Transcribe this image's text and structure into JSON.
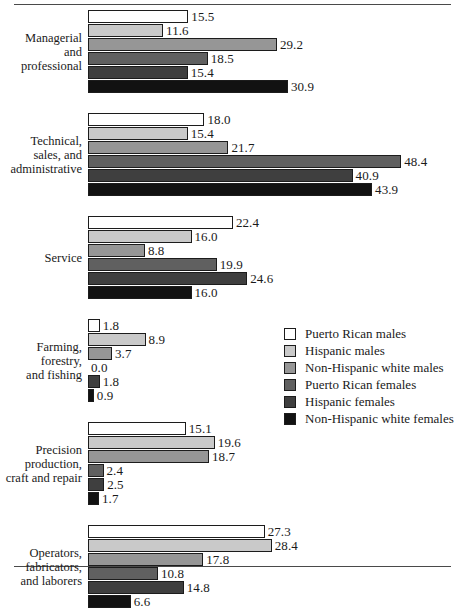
{
  "chart_data": {
    "type": "bar",
    "title": "",
    "subtitle": "",
    "xlabel": "",
    "ylabel": "",
    "orientation": "horizontal",
    "grid": false,
    "legend_position": "middle-right",
    "xlim": [
      0,
      50
    ],
    "categories": [
      "Managerial and professional",
      "Technical, sales, and administrative",
      "Service",
      "Farming, forestry, and fishing",
      "Precision production, craft and repair",
      "Operators, fabricators, and laborers"
    ],
    "series": [
      {
        "name": "Puerto Rican males",
        "color": "#ffffff",
        "values": [
          15.5,
          18.0,
          22.4,
          1.8,
          15.1,
          27.3
        ]
      },
      {
        "name": "Hispanic males",
        "color": "#c9c9c9",
        "values": [
          11.6,
          15.4,
          16.0,
          8.9,
          19.6,
          28.4
        ]
      },
      {
        "name": "Non-Hispanic white males",
        "color": "#969696",
        "values": [
          29.2,
          21.7,
          8.8,
          3.7,
          18.7,
          17.8
        ]
      },
      {
        "name": "Puerto Rican females",
        "color": "#606060",
        "values": [
          18.5,
          48.4,
          19.9,
          0.0,
          2.4,
          10.8
        ]
      },
      {
        "name": "Hispanic females",
        "color": "#3f3f3f",
        "values": [
          15.4,
          40.9,
          24.6,
          1.8,
          2.5,
          14.8
        ]
      },
      {
        "name": "Non-Hispanic white females",
        "color": "#121212",
        "values": [
          30.9,
          43.9,
          16.0,
          0.9,
          1.7,
          6.6
        ]
      }
    ]
  },
  "groups": [
    {
      "label_lines": [
        "Managerial",
        "and",
        "professional"
      ],
      "bars": [
        {
          "value": 15.5,
          "label": "15.5",
          "series": 0
        },
        {
          "value": 11.6,
          "label": "11.6",
          "series": 1
        },
        {
          "value": 29.2,
          "label": "29.2",
          "series": 2
        },
        {
          "value": 18.5,
          "label": "18.5",
          "series": 3
        },
        {
          "value": 15.4,
          "label": "15.4",
          "series": 4
        },
        {
          "value": 30.9,
          "label": "30.9",
          "series": 5
        }
      ]
    },
    {
      "label_lines": [
        "Technical,",
        "sales, and",
        "administrative"
      ],
      "bars": [
        {
          "value": 18.0,
          "label": "18.0",
          "series": 0
        },
        {
          "value": 15.4,
          "label": "15.4",
          "series": 1
        },
        {
          "value": 21.7,
          "label": "21.7",
          "series": 2
        },
        {
          "value": 48.4,
          "label": "48.4",
          "series": 3
        },
        {
          "value": 40.9,
          "label": "40.9",
          "series": 4
        },
        {
          "value": 43.9,
          "label": "43.9",
          "series": 5
        }
      ]
    },
    {
      "label_lines": [
        "Service"
      ],
      "bars": [
        {
          "value": 22.4,
          "label": "22.4",
          "series": 0
        },
        {
          "value": 16.0,
          "label": "16.0",
          "series": 1
        },
        {
          "value": 8.8,
          "label": "8.8",
          "series": 2
        },
        {
          "value": 19.9,
          "label": "19.9",
          "series": 3
        },
        {
          "value": 24.6,
          "label": "24.6",
          "series": 4
        },
        {
          "value": 16.0,
          "label": "16.0",
          "series": 5
        }
      ]
    },
    {
      "label_lines": [
        "Farming,",
        "forestry,",
        "and fishing"
      ],
      "bars": [
        {
          "value": 1.8,
          "label": "1.8",
          "series": 0
        },
        {
          "value": 8.9,
          "label": "8.9",
          "series": 1
        },
        {
          "value": 3.7,
          "label": "3.7",
          "series": 2
        },
        {
          "value": 0.0,
          "label": "0.0",
          "series": 3
        },
        {
          "value": 1.8,
          "label": "1.8",
          "series": 4
        },
        {
          "value": 0.9,
          "label": "0.9",
          "series": 5
        }
      ]
    },
    {
      "label_lines": [
        "Precision",
        "production,",
        "craft and repair"
      ],
      "bars": [
        {
          "value": 15.1,
          "label": "15.1",
          "series": 0
        },
        {
          "value": 19.6,
          "label": "19.6",
          "series": 1
        },
        {
          "value": 18.7,
          "label": "18.7",
          "series": 2
        },
        {
          "value": 2.4,
          "label": "2.4",
          "series": 3
        },
        {
          "value": 2.5,
          "label": "2.5",
          "series": 4
        },
        {
          "value": 1.7,
          "label": "1.7",
          "series": 5
        }
      ]
    },
    {
      "label_lines": [
        "Operators,",
        "fabricators,",
        "and laborers"
      ],
      "bars": [
        {
          "value": 27.3,
          "label": "27.3",
          "series": 0
        },
        {
          "value": 28.4,
          "label": "28.4",
          "series": 1
        },
        {
          "value": 17.8,
          "label": "17.8",
          "series": 2
        },
        {
          "value": 10.8,
          "label": "10.8",
          "series": 3
        },
        {
          "value": 14.8,
          "label": "14.8",
          "series": 4
        },
        {
          "value": 6.6,
          "label": "6.6",
          "series": 5
        }
      ]
    }
  ],
  "legend": {
    "items": [
      {
        "label": "Puerto Rican males",
        "series": 0
      },
      {
        "label": "Hispanic males",
        "series": 1
      },
      {
        "label": "Non-Hispanic white males",
        "series": 2
      },
      {
        "label": "Puerto Rican females",
        "series": 3
      },
      {
        "label": "Hispanic females",
        "series": 4
      },
      {
        "label": "Non-Hispanic white females",
        "series": 5
      }
    ]
  },
  "scale": {
    "px_per_unit": 6.47
  }
}
